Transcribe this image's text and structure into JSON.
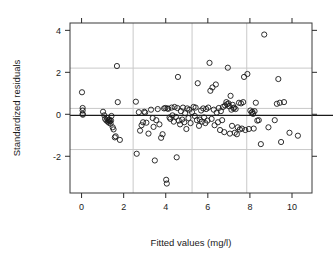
{
  "chart_data": {
    "type": "scatter",
    "title": "",
    "xlabel": "Fitted values (mg/l)",
    "ylabel": "Standardized residuals",
    "xlim": [
      -0.55,
      10.95
    ],
    "ylim": [
      -3.75,
      4.35
    ],
    "xticks": [
      0,
      2,
      4,
      6,
      8,
      10
    ],
    "yticks": [
      -2,
      0,
      2,
      4
    ],
    "xticklabels": [
      "0",
      "2",
      "4",
      "6",
      "8",
      "10"
    ],
    "yticklabels": [
      "-2",
      "0",
      "2",
      "4"
    ],
    "grid": true,
    "grid_color": "#c9c9c9",
    "vertical_gridlines": [
      2.45,
      5.25,
      7.85
    ],
    "horizontal_gridlines": [
      2.2,
      0.28,
      -1.68
    ],
    "reference_line": {
      "y": -0.05,
      "color": "#1a1a1a"
    },
    "marker": "open-circle",
    "marker_color": "#1a1a1a",
    "legend": null,
    "n_points": 148,
    "points": [
      [
        0.02,
        1.05
      ],
      [
        0.05,
        0.3
      ],
      [
        0.05,
        0.18
      ],
      [
        0.05,
        0.02
      ],
      [
        0.06,
        -0.02
      ],
      [
        1.02,
        0.12
      ],
      [
        1.08,
        -0.05
      ],
      [
        1.12,
        -0.22
      ],
      [
        1.18,
        -0.3
      ],
      [
        1.22,
        -0.18
      ],
      [
        1.25,
        -0.35
      ],
      [
        1.28,
        -0.28
      ],
      [
        1.3,
        -0.4
      ],
      [
        1.32,
        -0.25
      ],
      [
        1.35,
        -0.33
      ],
      [
        1.38,
        -0.45
      ],
      [
        1.4,
        -0.3
      ],
      [
        1.42,
        -0.08
      ],
      [
        1.48,
        -0.62
      ],
      [
        1.52,
        -0.72
      ],
      [
        1.58,
        -1.1
      ],
      [
        1.62,
        -1.05
      ],
      [
        1.68,
        2.3
      ],
      [
        1.72,
        0.58
      ],
      [
        1.82,
        -1.22
      ],
      [
        2.58,
        0.6
      ],
      [
        2.62,
        -1.88
      ],
      [
        2.72,
        0.1
      ],
      [
        2.78,
        -0.78
      ],
      [
        2.85,
        -0.52
      ],
      [
        2.92,
        -0.38
      ],
      [
        2.98,
        0.12
      ],
      [
        3.02,
        0.08
      ],
      [
        3.08,
        -0.4
      ],
      [
        3.18,
        -0.92
      ],
      [
        3.3,
        0.22
      ],
      [
        3.38,
        -0.18
      ],
      [
        3.42,
        -0.6
      ],
      [
        3.48,
        -2.2
      ],
      [
        3.55,
        -0.28
      ],
      [
        3.62,
        0.25
      ],
      [
        3.7,
        -0.48
      ],
      [
        3.78,
        -1.12
      ],
      [
        3.85,
        -0.95
      ],
      [
        3.92,
        0.28
      ],
      [
        3.98,
        0.3
      ],
      [
        4.02,
        -3.12
      ],
      [
        4.05,
        -3.3
      ],
      [
        4.08,
        0.28
      ],
      [
        4.12,
        0.26
      ],
      [
        4.18,
        -0.15
      ],
      [
        4.22,
        -0.22
      ],
      [
        4.28,
        0.32
      ],
      [
        4.32,
        -0.05
      ],
      [
        4.38,
        -0.35
      ],
      [
        4.42,
        0.35
      ],
      [
        4.48,
        -0.12
      ],
      [
        4.52,
        -2.05
      ],
      [
        4.55,
        0.3
      ],
      [
        4.58,
        1.78
      ],
      [
        4.62,
        -0.3
      ],
      [
        4.68,
        -0.48
      ],
      [
        4.72,
        0.15
      ],
      [
        4.78,
        -0.25
      ],
      [
        4.82,
        0.32
      ],
      [
        4.88,
        -0.38
      ],
      [
        4.92,
        0.05
      ],
      [
        4.98,
        -0.7
      ],
      [
        5.02,
        0.28
      ],
      [
        5.08,
        -0.18
      ],
      [
        5.12,
        0.22
      ],
      [
        5.18,
        -0.42
      ],
      [
        5.25,
        0.1
      ],
      [
        5.32,
        0.35
      ],
      [
        5.38,
        -0.08
      ],
      [
        5.42,
        0.32
      ],
      [
        5.48,
        -0.28
      ],
      [
        5.52,
        1.48
      ],
      [
        5.58,
        -0.55
      ],
      [
        5.62,
        -0.25
      ],
      [
        5.68,
        0.18
      ],
      [
        5.72,
        -0.35
      ],
      [
        5.78,
        0.28
      ],
      [
        5.82,
        -0.15
      ],
      [
        5.88,
        -0.42
      ],
      [
        5.92,
        0.25
      ],
      [
        5.98,
        -0.3
      ],
      [
        6.02,
        0.32
      ],
      [
        6.08,
        2.45
      ],
      [
        6.12,
        1.12
      ],
      [
        6.18,
        -0.22
      ],
      [
        6.22,
        1.28
      ],
      [
        6.28,
        0.22
      ],
      [
        6.32,
        -0.52
      ],
      [
        6.38,
        1.42
      ],
      [
        6.42,
        0.08
      ],
      [
        6.48,
        -0.38
      ],
      [
        6.52,
        0.3
      ],
      [
        6.58,
        -0.75
      ],
      [
        6.62,
        0.15
      ],
      [
        6.68,
        -0.28
      ],
      [
        6.72,
        0.35
      ],
      [
        6.78,
        -0.85
      ],
      [
        6.82,
        0.42
      ],
      [
        6.88,
        0.58
      ],
      [
        6.92,
        0.48
      ],
      [
        6.95,
        2.22
      ],
      [
        6.98,
        0.52
      ],
      [
        7.02,
        0.38
      ],
      [
        7.05,
        -0.92
      ],
      [
        7.08,
        0.88
      ],
      [
        7.12,
        0.22
      ],
      [
        7.15,
        -0.55
      ],
      [
        7.18,
        0.45
      ],
      [
        7.22,
        0.28
      ],
      [
        7.25,
        0.32
      ],
      [
        7.28,
        -0.88
      ],
      [
        7.32,
        0.25
      ],
      [
        7.38,
        -0.95
      ],
      [
        7.42,
        -0.62
      ],
      [
        7.48,
        0.55
      ],
      [
        7.52,
        -0.72
      ],
      [
        7.58,
        0.52
      ],
      [
        7.62,
        -0.68
      ],
      [
        7.68,
        0.58
      ],
      [
        7.72,
        1.78
      ],
      [
        7.78,
        -0.75
      ],
      [
        7.88,
        1.92
      ],
      [
        7.95,
        -0.7
      ],
      [
        8.02,
        0.18
      ],
      [
        8.08,
        0.08
      ],
      [
        8.12,
        0.12
      ],
      [
        8.15,
        0.02
      ],
      [
        8.18,
        -0.68
      ],
      [
        8.22,
        0.15
      ],
      [
        8.28,
        0.55
      ],
      [
        8.35,
        -0.3
      ],
      [
        8.42,
        -0.28
      ],
      [
        8.52,
        -1.42
      ],
      [
        8.68,
        3.8
      ],
      [
        8.88,
        -0.62
      ],
      [
        9.18,
        -0.28
      ],
      [
        9.28,
        0.5
      ],
      [
        9.35,
        1.68
      ],
      [
        9.42,
        0.55
      ],
      [
        9.48,
        -1.32
      ],
      [
        9.62,
        0.58
      ],
      [
        9.88,
        -0.88
      ],
      [
        10.28,
        -1.02
      ]
    ]
  },
  "labels": {
    "x_axis_title": "Fitted values (mg/l)",
    "y_axis_title": "Standardized residuals"
  }
}
